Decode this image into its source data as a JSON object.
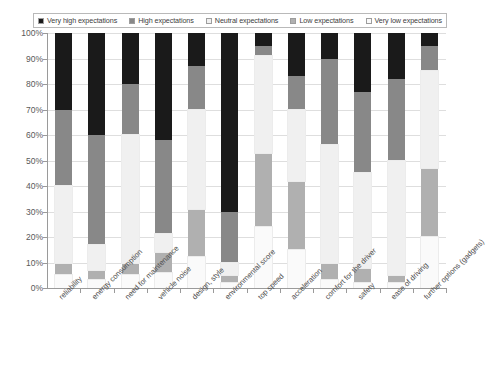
{
  "legend": {
    "items": [
      {
        "label": "Very high expectations",
        "color": "#1a1a1a"
      },
      {
        "label": "High expectations",
        "color": "#888888"
      },
      {
        "label": "Neutral expectations",
        "color": "#f0f0f0"
      },
      {
        "label": "Low expectations",
        "color": "#b0b0b0"
      },
      {
        "label": "Very low expectations",
        "color": "#fafafa"
      }
    ]
  },
  "axes": {
    "y_ticks": [
      "100%",
      "90%",
      "80%",
      "70%",
      "60%",
      "50%",
      "40%",
      "30%",
      "20%",
      "10%",
      "0%"
    ]
  },
  "chart_data": {
    "type": "bar",
    "title": "",
    "xlabel": "",
    "ylabel": "",
    "ylim": [
      0,
      100
    ],
    "grid": true,
    "stacked": true,
    "legend_position": "top",
    "categories": [
      "reliability",
      "energy consumption",
      "need for maintenance",
      "vehicle noise",
      "design, style",
      "environmental score",
      "top speed",
      "acceleration",
      "comfort for the driver",
      "safety",
      "ease of driving",
      "further options (gadgets)"
    ],
    "series": [
      {
        "name": "Very high expectations",
        "color": "#1a1a1a",
        "values": [
          30,
          40,
          20,
          42,
          13,
          70,
          5,
          17,
          10,
          23,
          18,
          5
        ]
      },
      {
        "name": "High expectations",
        "color": "#888888",
        "values": [
          30,
          43,
          20,
          37,
          17,
          20,
          4,
          13,
          34,
          32,
          32,
          10
        ]
      },
      {
        "name": "Neutral expectations",
        "color": "#f0f0f0",
        "values": [
          30,
          10,
          50,
          7,
          39,
          5,
          38,
          28,
          46,
          37,
          45,
          38
        ]
      },
      {
        "name": "Low expectations",
        "color": "#b0b0b0",
        "values": [
          5,
          4,
          5,
          8,
          19,
          3,
          29,
          27,
          7,
          6,
          3,
          27
        ]
      },
      {
        "name": "Very low expectations",
        "color": "#fafafa",
        "values": [
          5,
          3,
          5,
          6,
          12,
          2,
          24,
          15,
          3,
          2,
          2,
          20
        ]
      }
    ]
  }
}
